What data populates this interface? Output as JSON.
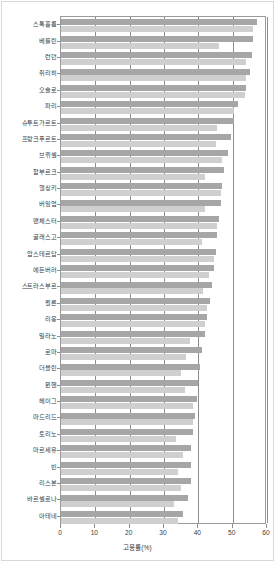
{
  "chart_data": {
    "type": "bar",
    "orientation": "horizontal",
    "title": "",
    "xlabel": "고용률(%)",
    "ylabel": "",
    "xlim": [
      0,
      60
    ],
    "ylim": null,
    "grid": true,
    "grid_axis": "x",
    "legend": false,
    "legend_position": "none",
    "xticks": [
      0,
      10,
      20,
      30,
      40,
      50,
      60
    ],
    "xtick_labels": [
      "0",
      "10",
      "20",
      "30",
      "40",
      "50",
      "60"
    ],
    "categories": [
      "스톡홀름",
      "베를린",
      "런던",
      "취리히",
      "오슬로",
      "파리",
      "슈투트가르트",
      "프랑크푸르트",
      "브뤼셀",
      "함부르크",
      "헬싱키",
      "버밍엄",
      "맨체스터",
      "글래스고",
      "암스테르담",
      "에든버러",
      "스트라스부르",
      "쾰른",
      "리옹",
      "밀라노",
      "로마",
      "더블린",
      "뮌헨",
      "헤이그",
      "마드리드",
      "토리노",
      "마르세유",
      "빈",
      "리스본",
      "바르셀로나",
      "아테네"
    ],
    "series": [
      {
        "name": "계열1",
        "color": "#a6a6a6",
        "values": [
          57.0,
          56.0,
          55.5,
          55.0,
          54.0,
          51.5,
          50.5,
          49.5,
          48.5,
          47.5,
          47.0,
          46.5,
          46.0,
          45.5,
          45.0,
          44.5,
          44.0,
          43.5,
          42.5,
          42.0,
          41.0,
          40.5,
          40.0,
          39.5,
          39.0,
          38.5,
          38.0,
          38.0,
          38.0,
          37.0,
          35.5
        ]
      },
      {
        "name": "계열2",
        "color": "#cfcfcf",
        "values": [
          56.0,
          46.0,
          54.0,
          54.0,
          53.5,
          50.5,
          45.5,
          45.0,
          47.0,
          42.0,
          46.5,
          42.0,
          45.5,
          41.0,
          44.5,
          43.0,
          41.5,
          42.5,
          42.0,
          37.5,
          36.5,
          35.0,
          36.0,
          38.5,
          38.5,
          33.5,
          35.5,
          34.0,
          35.0,
          33.0,
          34.0
        ]
      }
    ]
  },
  "axes": {
    "x_label": "고용률(%)"
  }
}
